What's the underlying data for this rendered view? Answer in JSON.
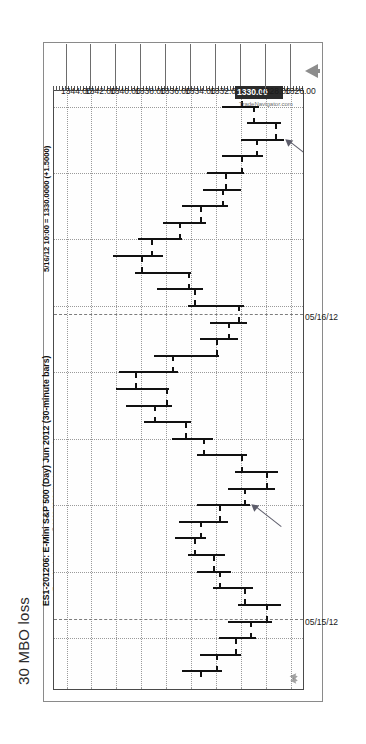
{
  "caption": "30 MBO loss",
  "chart": {
    "title": "ES1-201206:  E-Mini S&P 500 (Day) Jun 2012  (30-minute bars)",
    "subtitle": "www.TradeNavigator.com © 1999-2012 All rights reserved",
    "callout": "5/16/12 10:00 = 1330.0000 (+1.5000)",
    "watermark": "TradeNavigator.com",
    "logo_icon": "eagle-logo-icon",
    "axis_arrow_icon": "up-arrow-icon"
  },
  "chart_data": {
    "type": "bar",
    "subtype": "ohlc",
    "title": "ES1-201206:  E-Mini S&P 500 (Day) Jun 2012  (30-minute bars)",
    "xlabel": "",
    "ylabel": "Price",
    "grid": true,
    "legend": "none",
    "ylim": [
      1325.0,
      1345.0
    ],
    "yticks": [
      "1344.00",
      "1342.00",
      "1340.00",
      "1338.00",
      "1336.00",
      "1334.00",
      "1332.00",
      "1330.00",
      "1328.00",
      "1326.00"
    ],
    "ytick_values": [
      1344.0,
      1342.0,
      1340.0,
      1338.0,
      1336.0,
      1334.0,
      1332.0,
      1330.0,
      1328.0,
      1326.0
    ],
    "highlighted_ytick": "1330.00",
    "xticks": [
      "05/15/12",
      "05/16/12"
    ],
    "xtick_positions": [
      0.115,
      0.625
    ],
    "last_price": 1330.0,
    "last_change": 1.5,
    "last_timestamp": "5/16/12 10:00",
    "annotations": [
      {
        "text": "",
        "icon": "up-right-arrow-icon",
        "target": "bar-10"
      },
      {
        "text": "",
        "icon": "up-right-arrow-icon",
        "target": "bar-32"
      }
    ],
    "bars": [
      {
        "i": 0,
        "open": 1333.25,
        "high": 1334.75,
        "low": 1331.5,
        "close": 1332.0
      },
      {
        "i": 1,
        "open": 1332.0,
        "high": 1333.25,
        "low": 1330.0,
        "close": 1330.5
      },
      {
        "i": 2,
        "open": 1330.5,
        "high": 1331.75,
        "low": 1328.75,
        "close": 1329.25
      },
      {
        "i": 3,
        "open": 1329.25,
        "high": 1331.0,
        "low": 1327.5,
        "close": 1328.0
      },
      {
        "i": 4,
        "open": 1328.0,
        "high": 1330.25,
        "low": 1326.75,
        "close": 1329.75
      },
      {
        "i": 5,
        "open": 1329.75,
        "high": 1332.25,
        "low": 1329.0,
        "close": 1331.75
      },
      {
        "i": 6,
        "open": 1331.75,
        "high": 1333.5,
        "low": 1330.75,
        "close": 1332.25
      },
      {
        "i": 7,
        "open": 1332.25,
        "high": 1334.25,
        "low": 1331.25,
        "close": 1333.75
      },
      {
        "i": 8,
        "open": 1333.75,
        "high": 1335.25,
        "low": 1332.75,
        "close": 1333.25
      },
      {
        "i": 9,
        "open": 1333.25,
        "high": 1335.0,
        "low": 1331.0,
        "close": 1331.75
      },
      {
        "i": 10,
        "open": 1331.75,
        "high": 1333.5,
        "low": 1329.25,
        "close": 1329.75
      },
      {
        "i": 11,
        "open": 1329.75,
        "high": 1331.0,
        "low": 1327.25,
        "close": 1328.0
      },
      {
        "i": 12,
        "open": 1328.0,
        "high": 1330.5,
        "low": 1327.0,
        "close": 1330.0
      },
      {
        "i": 13,
        "open": 1330.0,
        "high": 1333.5,
        "low": 1329.5,
        "close": 1333.0
      },
      {
        "i": 14,
        "open": 1333.0,
        "high": 1335.5,
        "low": 1332.25,
        "close": 1334.5
      },
      {
        "i": 15,
        "open": 1334.5,
        "high": 1337.75,
        "low": 1334.0,
        "close": 1337.0
      },
      {
        "i": 16,
        "open": 1337.0,
        "high": 1339.25,
        "low": 1335.5,
        "close": 1336.0
      },
      {
        "i": 17,
        "open": 1336.0,
        "high": 1340.0,
        "low": 1335.75,
        "close": 1338.5
      },
      {
        "i": 18,
        "open": 1338.5,
        "high": 1339.75,
        "low": 1335.0,
        "close": 1335.5
      },
      {
        "i": 19,
        "open": 1335.5,
        "high": 1337.0,
        "low": 1331.75,
        "close": 1332.0
      },
      {
        "i": 20,
        "open": 1332.0,
        "high": 1333.25,
        "low": 1330.25,
        "close": 1331.0
      },
      {
        "i": 21,
        "open": 1331.0,
        "high": 1332.5,
        "low": 1329.5,
        "close": 1330.25
      },
      {
        "i": 22,
        "open": 1330.25,
        "high": 1334.25,
        "low": 1329.75,
        "close": 1333.75
      },
      {
        "i": 23,
        "open": 1333.75,
        "high": 1336.75,
        "low": 1333.0,
        "close": 1334.25
      },
      {
        "i": 24,
        "open": 1334.25,
        "high": 1338.5,
        "low": 1334.0,
        "close": 1338.0
      },
      {
        "i": 25,
        "open": 1338.0,
        "high": 1340.25,
        "low": 1336.25,
        "close": 1337.25
      },
      {
        "i": 26,
        "open": 1337.25,
        "high": 1338.25,
        "low": 1334.75,
        "close": 1335.0
      },
      {
        "i": 27,
        "open": 1335.0,
        "high": 1336.25,
        "low": 1332.75,
        "close": 1333.25
      },
      {
        "i": 28,
        "open": 1333.25,
        "high": 1334.75,
        "low": 1331.0,
        "close": 1331.5
      },
      {
        "i": 29,
        "open": 1331.5,
        "high": 1333.0,
        "low": 1330.0,
        "close": 1331.25
      },
      {
        "i": 30,
        "open": 1331.25,
        "high": 1332.75,
        "low": 1329.75,
        "close": 1330.0
      },
      {
        "i": 31,
        "open": 1330.0,
        "high": 1331.5,
        "low": 1328.25,
        "close": 1328.75
      },
      {
        "i": 32,
        "open": 1328.75,
        "high": 1330.0,
        "low": 1326.5,
        "close": 1327.25
      },
      {
        "i": 33,
        "open": 1327.25,
        "high": 1329.5,
        "low": 1326.75,
        "close": 1329.0
      },
      {
        "i": 34,
        "open": 1329.0,
        "high": 1331.5,
        "low": 1328.5,
        "close": 1330.0
      }
    ]
  }
}
